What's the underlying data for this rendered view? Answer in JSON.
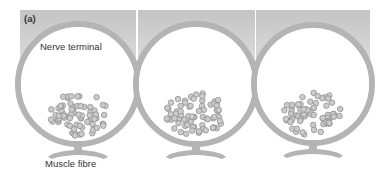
{
  "figure": {
    "panel_label": "(a)",
    "labels": {
      "nerve_terminal": "Nerve terminal",
      "muscle_fibre": "Muscle fibre"
    },
    "panels": [
      {
        "id": "panel-1",
        "x": 20,
        "width": 117
      },
      {
        "id": "panel-2",
        "x": 138,
        "width": 117
      },
      {
        "id": "panel-3",
        "x": 256,
        "width": 114
      }
    ],
    "colors": {
      "background": "#ffffff",
      "membrane": "#b4b4b4",
      "membrane_dark": "#a0a0a0",
      "top_band": "#c8c8c8",
      "vesicle_fill": "#c8c8c8",
      "vesicle_stroke": "#8c8c8c",
      "text": "#333333"
    }
  }
}
